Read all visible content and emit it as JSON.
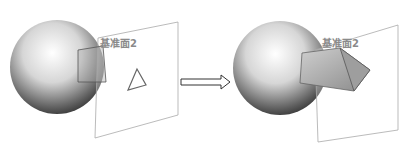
{
  "diagram": {
    "left": {
      "plane_label": "基准面2",
      "description": "Sphere with sketch plane and triangle profile"
    },
    "right": {
      "plane_label": "基准面2",
      "description": "Sphere with extruded triangular prism through plane"
    },
    "arrow": "hollow-right-arrow"
  }
}
